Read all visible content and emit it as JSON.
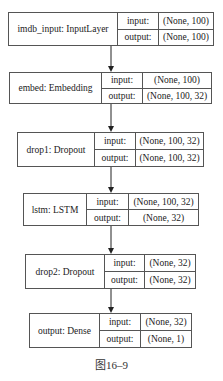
{
  "diagram": {
    "nodes": [
      {
        "name": "imdb_input: InputLayer",
        "input_label": "input:",
        "output_label": "output:",
        "input_shape": "(None, 100)",
        "output_shape": "(None, 100)"
      },
      {
        "name": "embed: Embedding",
        "input_label": "input:",
        "output_label": "output:",
        "input_shape": "(None, 100)",
        "output_shape": "(None, 100, 32)"
      },
      {
        "name": "drop1: Dropout",
        "input_label": "input:",
        "output_label": "output:",
        "input_shape": "(None, 100, 32)",
        "output_shape": "(None, 100, 32)"
      },
      {
        "name": "lstm: LSTM",
        "input_label": "input:",
        "output_label": "output:",
        "input_shape": "(None, 100, 32)",
        "output_shape": "(None, 32)"
      },
      {
        "name": "drop2: Dropout",
        "input_label": "input:",
        "output_label": "output:",
        "input_shape": "(None, 32)",
        "output_shape": "(None, 32)"
      },
      {
        "name": "output: Dense",
        "input_label": "input:",
        "output_label": "output:",
        "input_shape": "(None, 32)",
        "output_shape": "(None, 1)"
      }
    ],
    "edges": [
      [
        0,
        1
      ],
      [
        1,
        2
      ],
      [
        2,
        3
      ],
      [
        3,
        4
      ],
      [
        4,
        5
      ]
    ],
    "caption": "图16–9"
  }
}
